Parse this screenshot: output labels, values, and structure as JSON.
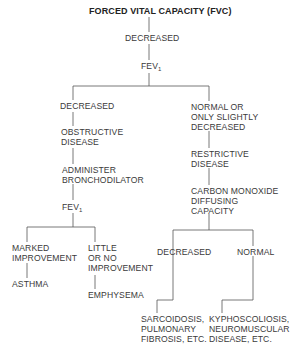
{
  "diagram": {
    "title": "FORCED VITAL CAPACITY (FVC)",
    "line_color": "#555555",
    "nodes": {
      "fvc_decreased": "DECREASED",
      "fev1_top": "FEV",
      "fev1_top_sub": "1",
      "left_decreased": "DECREASED",
      "right_normal": "NORMAL OR\nONLY SLIGHTLY\nDECREASED",
      "obstructive": "OBSTRUCTIVE\nDISEASE",
      "bronchodilator": "ADMINISTER\nBRONCHODILATOR",
      "fev1_left": "FEV",
      "fev1_left_sub": "1",
      "marked": "MARKED\nIMPROVEMENT",
      "little": "LITTLE\nOR NO\nIMPROVEMENT",
      "asthma": "ASTHMA",
      "emphysema": "EMPHYSEMA",
      "restrictive": "RESTRICTIVE\nDISEASE",
      "co_diffusing": "CARBON MONOXIDE\nDIFFUSING\nCAPACITY",
      "dlco_decreased": "DECREASED",
      "dlco_normal": "NORMAL",
      "sarcoidosis": "SARCOIDOSIS,\nPULMONARY\nFIBROSIS, ETC.",
      "kyphoscoliosis": "KYPHOSCOLIOSIS,\nNEUROMUSCULAR\nDISEASE, ETC."
    }
  }
}
